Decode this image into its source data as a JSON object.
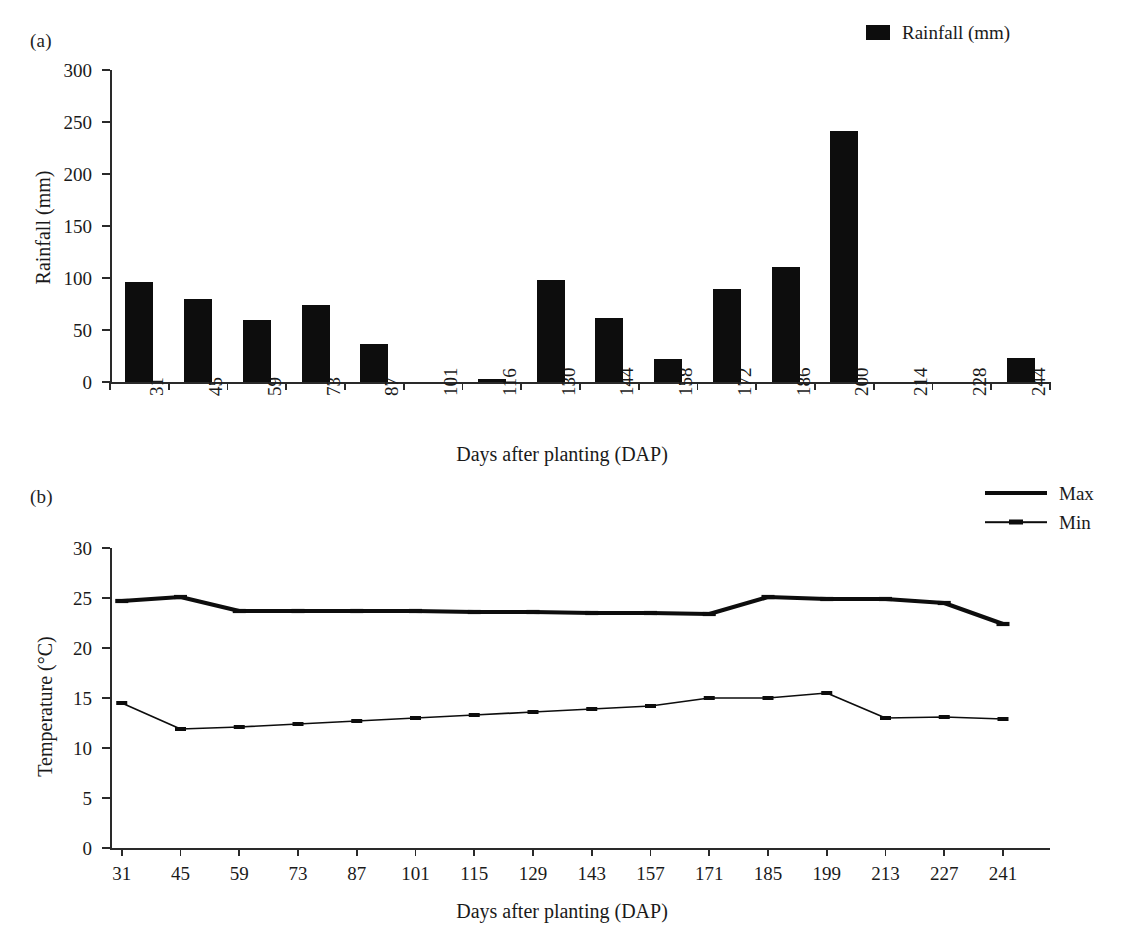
{
  "figure": {
    "panel_a_tag": "(a)",
    "panel_b_tag": "(b)"
  },
  "panel_a": {
    "legend": [
      {
        "label": "Rainfall (mm)",
        "style": "bar",
        "color": "#0d0d0d"
      }
    ],
    "y_axis_title": "Rainfall (mm)",
    "x_axis_title": "Days after planting (DAP)"
  },
  "panel_b": {
    "legend": [
      {
        "label": "Max",
        "style": "thick-line",
        "color": "#0d0d0d"
      },
      {
        "label": "Min",
        "style": "thin-line",
        "color": "#0d0d0d"
      }
    ],
    "y_axis_title": "Temperature (°C)",
    "x_axis_title": "Days after planting (DAP)"
  },
  "chart_data": [
    {
      "type": "bar",
      "panel": "(a)",
      "title": "",
      "xlabel": "Days after planting (DAP)",
      "ylabel": "Rainfall (mm)",
      "categories": [
        "31",
        "45",
        "59",
        "73",
        "87",
        "101",
        "116",
        "130",
        "144",
        "158",
        "172",
        "186",
        "200",
        "214",
        "228",
        "244"
      ],
      "values": [
        96,
        80,
        60,
        74,
        37,
        0,
        3,
        98,
        62,
        22,
        89,
        111,
        241,
        0,
        0,
        23
      ],
      "series": [
        {
          "name": "Rainfall (mm)",
          "values": [
            96,
            80,
            60,
            74,
            37,
            0,
            3,
            98,
            62,
            22,
            89,
            111,
            241,
            0,
            0,
            23
          ]
        }
      ],
      "ylim": [
        0,
        300
      ],
      "yticks": [
        0,
        50,
        100,
        150,
        200,
        250,
        300
      ],
      "ytick_labels": [
        "0",
        "50",
        "100",
        "150",
        "200",
        "250",
        "300"
      ],
      "grid": false,
      "legend": [
        "Rainfall (mm)"
      ],
      "legend_position": "top-right",
      "bar_color": "#0d0d0d"
    },
    {
      "type": "line",
      "panel": "(b)",
      "title": "",
      "xlabel": "Days after planting (DAP)",
      "ylabel": "Temperature (°C)",
      "x": [
        31,
        45,
        59,
        73,
        87,
        101,
        115,
        129,
        143,
        157,
        171,
        185,
        199,
        213,
        227,
        241
      ],
      "xtick_labels": [
        "31",
        "45",
        "59",
        "73",
        "87",
        "101",
        "115",
        "129",
        "143",
        "157",
        "171",
        "185",
        "199",
        "213",
        "227",
        "241"
      ],
      "series": [
        {
          "name": "Max",
          "values": [
            24.7,
            25.1,
            23.7,
            23.7,
            23.7,
            23.7,
            23.6,
            23.6,
            23.5,
            23.5,
            23.4,
            25.1,
            24.9,
            24.9,
            24.5,
            22.4
          ]
        },
        {
          "name": "Min",
          "values": [
            14.5,
            11.9,
            12.1,
            12.4,
            12.7,
            13.0,
            13.3,
            13.6,
            13.9,
            14.2,
            15.0,
            15.0,
            15.5,
            13.0,
            13.1,
            12.9
          ]
        }
      ],
      "ylim": [
        0,
        30
      ],
      "yticks": [
        0,
        5,
        10,
        15,
        20,
        25,
        30
      ],
      "ytick_labels": [
        "0",
        "5",
        "10",
        "15",
        "20",
        "25",
        "30"
      ],
      "grid": false,
      "legend": [
        "Max",
        "Min"
      ],
      "legend_position": "top-right",
      "line_color": "#0d0d0d"
    }
  ]
}
